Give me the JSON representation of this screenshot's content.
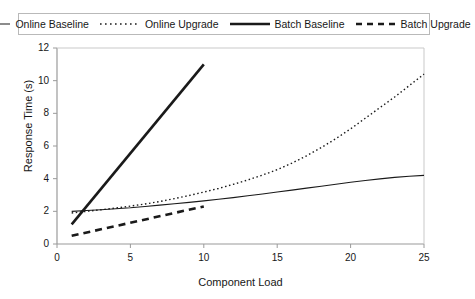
{
  "chart_data": {
    "type": "line",
    "title": "",
    "xlabel": "Component Load",
    "ylabel": "Response Time (s)",
    "xlim": [
      0,
      25
    ],
    "ylim": [
      0,
      12
    ],
    "xticks": [
      0,
      5,
      10,
      15,
      20,
      25
    ],
    "yticks": [
      0,
      2,
      4,
      6,
      8,
      10,
      12
    ],
    "grid": false,
    "legend_position": "top",
    "series": [
      {
        "name": "Online Baseline",
        "style": "solid-thin",
        "color": "#1a1a1a",
        "x": [
          1,
          2,
          3,
          4,
          5,
          6,
          7,
          8,
          9,
          10,
          11,
          12,
          13,
          14,
          15,
          16,
          17,
          18,
          19,
          20,
          21,
          22,
          23,
          24,
          25
        ],
        "y": [
          2.0,
          2.05,
          2.1,
          2.16,
          2.22,
          2.3,
          2.38,
          2.46,
          2.55,
          2.64,
          2.74,
          2.84,
          2.95,
          3.06,
          3.18,
          3.3,
          3.42,
          3.54,
          3.66,
          3.78,
          3.89,
          3.99,
          4.08,
          4.15,
          4.2
        ]
      },
      {
        "name": "Online Upgrade",
        "style": "dotted",
        "color": "#1a1a1a",
        "x": [
          1,
          2,
          3,
          4,
          5,
          6,
          7,
          8,
          9,
          10,
          11,
          12,
          13,
          14,
          15,
          16,
          17,
          18,
          19,
          20,
          21,
          22,
          23,
          24,
          25
        ],
        "y": [
          1.9,
          2.0,
          2.1,
          2.2,
          2.32,
          2.45,
          2.6,
          2.78,
          2.97,
          3.18,
          3.4,
          3.65,
          3.92,
          4.22,
          4.55,
          4.95,
          5.4,
          5.9,
          6.45,
          7.05,
          7.7,
          8.35,
          9.0,
          9.7,
          10.4
        ]
      },
      {
        "name": "Batch Baseline",
        "style": "solid-thick",
        "color": "#1a1a1a",
        "x": [
          1,
          10
        ],
        "y": [
          1.2,
          11.0
        ]
      },
      {
        "name": "Batch Upgrade",
        "style": "dashed-thick",
        "color": "#1a1a1a",
        "x": [
          1,
          10
        ],
        "y": [
          0.5,
          2.3
        ]
      }
    ]
  },
  "legend": {
    "items": [
      {
        "label": "Online Baseline"
      },
      {
        "label": "Online Upgrade"
      },
      {
        "label": "Batch Baseline"
      },
      {
        "label": "Batch Upgrade"
      }
    ]
  },
  "axes": {
    "y_title": "Response Time (s)",
    "x_title": "Component Load",
    "y_ticks": [
      "0",
      "2",
      "4",
      "6",
      "8",
      "10",
      "12"
    ],
    "x_ticks": [
      "0",
      "5",
      "10",
      "15",
      "20",
      "25"
    ]
  },
  "colors": {
    "line": "#1a1a1a",
    "axis": "#8c8c8c",
    "legend_border": "#b9b9b9",
    "background": "#ffffff"
  }
}
